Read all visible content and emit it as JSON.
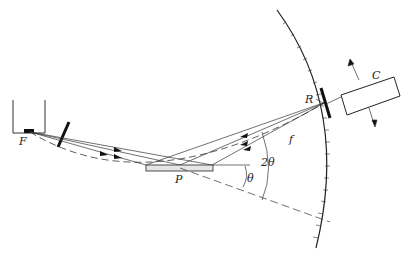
{
  "diagram": {
    "type": "x-ray diffractometer geometry",
    "labels": {
      "source": "F",
      "specimen": "P",
      "receiving_slit": "R",
      "counter": "C",
      "focusing_circle": "f",
      "angle_theta": "θ",
      "angle_two_theta": "2θ"
    }
  }
}
